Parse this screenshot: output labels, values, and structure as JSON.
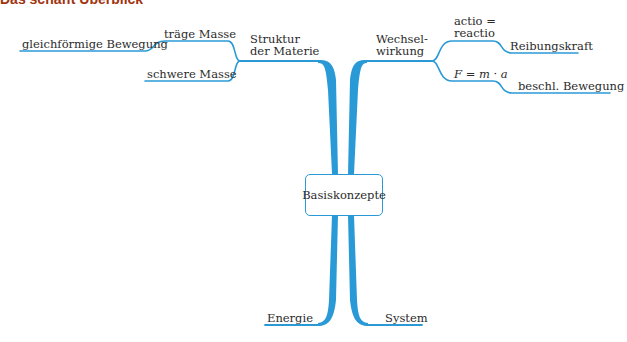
{
  "header": {
    "title": "Das schafft Überblick"
  },
  "colors": {
    "line": "#2a9ad6",
    "title": "#a0340f"
  },
  "mindmap": {
    "center": "Basiskonzepte",
    "branches": {
      "struktur": {
        "label_line1": "Struktur",
        "label_line2": "der Materie",
        "children": {
          "traege": "träge Masse",
          "traege_child": "gleichförmige Bewegung",
          "schwere": "schwere Masse"
        }
      },
      "wechselwirkung": {
        "label_line1": "Wechsel-",
        "label_line2": "wirkung",
        "children": {
          "actio_line1": "actio =",
          "actio_line2": "reactio",
          "actio_child": "Reibungskraft",
          "newton": "F = m · a",
          "newton_child": "beschl. Bewegung"
        }
      },
      "energie": {
        "label": "Energie"
      },
      "system": {
        "label": "System"
      }
    }
  }
}
